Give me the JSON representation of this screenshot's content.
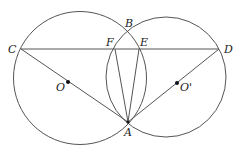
{
  "diagram": {
    "type": "geometry",
    "colors": {
      "stroke": "#555555",
      "text": "#222222",
      "background": "#ffffff"
    },
    "circles": [
      {
        "name": "O",
        "cx": 80,
        "cy": 78,
        "r": 66.5
      },
      {
        "name": "O'",
        "cx": 166,
        "cy": 77,
        "r": 60
      }
    ],
    "points": {
      "A": {
        "x": 128,
        "y": 122
      },
      "B": {
        "x": 128,
        "y": 32
      },
      "C": {
        "x": 21,
        "y": 49
      },
      "D": {
        "x": 219,
        "y": 49
      },
      "E": {
        "x": 139,
        "y": 49
      },
      "F": {
        "x": 115,
        "y": 49
      },
      "O": {
        "x": 68,
        "y": 82
      },
      "O'": {
        "x": 177,
        "y": 83
      }
    },
    "segments": [
      [
        "C",
        "D"
      ],
      [
        "C",
        "A"
      ],
      [
        "D",
        "A"
      ],
      [
        "F",
        "A"
      ],
      [
        "E",
        "A"
      ]
    ],
    "labels": [
      {
        "text": "A",
        "x": 124,
        "y": 136
      },
      {
        "text": "B",
        "x": 125,
        "y": 27
      },
      {
        "text": "C",
        "x": 8,
        "y": 53
      },
      {
        "text": "D",
        "x": 224,
        "y": 53
      },
      {
        "text": "E",
        "x": 140,
        "y": 46
      },
      {
        "text": "F",
        "x": 106,
        "y": 46
      },
      {
        "text": "O",
        "x": 56,
        "y": 91
      },
      {
        "text": "O'",
        "x": 180,
        "y": 91
      }
    ]
  }
}
